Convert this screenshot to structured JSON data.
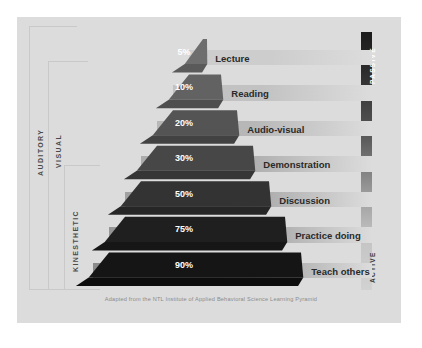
{
  "caption": "Adapted from the NTL Institute of Applied Behavioral Science Learning Pyramid",
  "side_labels": {
    "auditory": "AUDITORY",
    "visual": "VISUAL",
    "kinesthetic": "KINESTHETIC"
  },
  "scale": {
    "top": "PASSIVE",
    "bottom": "ACTIVE",
    "top_color": "#1c1c1c",
    "bottom_color": "#d2d2d2"
  },
  "colors": {
    "background": "#ffffff",
    "panel": "#dcdcdc",
    "bracket": "#c9c9c9",
    "text_dark": "#2a2a2a",
    "text_light": "#ffffff",
    "caption": "#8b8b8b"
  },
  "chart_data": {
    "type": "bar",
    "title": "Learning Pyramid",
    "subtitle": "Adapted from the NTL Institute of Applied Behavioral Science Learning Pyramid",
    "xlabel": "",
    "ylabel": "Average Retention Rate",
    "ylim": [
      0,
      100
    ],
    "categories": [
      "Lecture",
      "Reading",
      "Audio-visual",
      "Demonstration",
      "Discussion",
      "Practice doing",
      "Teach others"
    ],
    "values": [
      5,
      10,
      20,
      30,
      50,
      75,
      90
    ],
    "value_labels": [
      "5%",
      "10%",
      "20%",
      "30%",
      "50%",
      "75%",
      "90%"
    ],
    "legend": [
      "PASSIVE",
      "ACTIVE"
    ],
    "grid": false,
    "annotations": [
      "AUDITORY",
      "VISUAL",
      "KINESTHETIC"
    ],
    "tier_colors": [
      "#6e6e6e",
      "#626262",
      "#545454",
      "#474747",
      "#333333",
      "#1f1f1f",
      "#151515"
    ],
    "tier_side_colors": [
      "#5a5a5a",
      "#4e4e4e",
      "#424242",
      "#363636",
      "#262626",
      "#161616",
      "#0d0d0d"
    ]
  },
  "rows": [
    {
      "percent": "5%",
      "label": "Lecture",
      "value": 5,
      "mode": "AUDITORY"
    },
    {
      "percent": "10%",
      "label": "Reading",
      "value": 10,
      "mode": "VISUAL"
    },
    {
      "percent": "20%",
      "label": "Audio-visual",
      "value": 20,
      "mode": "VISUAL"
    },
    {
      "percent": "30%",
      "label": "Demonstration",
      "value": 30,
      "mode": "VISUAL"
    },
    {
      "percent": "50%",
      "label": "Discussion",
      "value": 50,
      "mode": "KINESTHETIC"
    },
    {
      "percent": "75%",
      "label": "Practice doing",
      "value": 75,
      "mode": "KINESTHETIC"
    },
    {
      "percent": "90%",
      "label": "Teach others",
      "value": 90,
      "mode": "KINESTHETIC"
    }
  ]
}
